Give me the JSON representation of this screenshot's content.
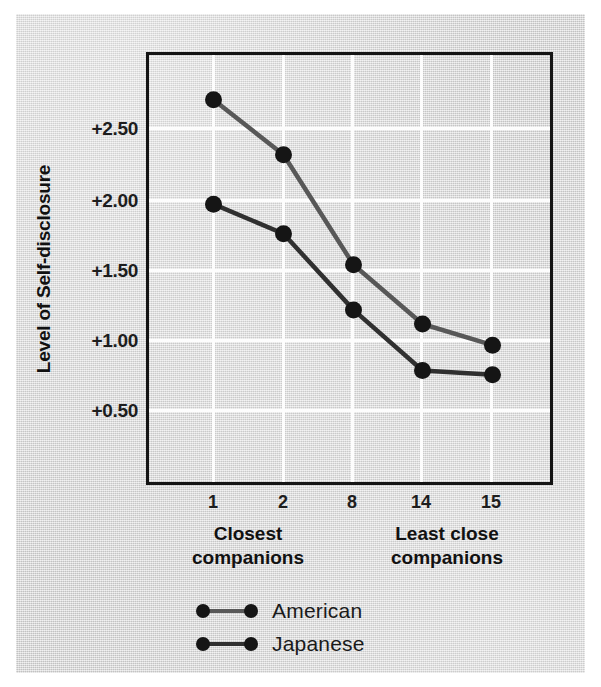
{
  "chart_data": {
    "type": "line",
    "title": "",
    "xlabel": "",
    "ylabel": "Level of Self-disclosure",
    "categories": [
      "1",
      "2",
      "8",
      "14",
      "15"
    ],
    "x_tick_labels": [
      "1",
      "2",
      "8",
      "14",
      "15"
    ],
    "y_tick_labels": [
      "+2.50",
      "+2.00",
      "+1.50",
      "+1.00",
      "+0.50"
    ],
    "y_tick_values": [
      2.5,
      2.0,
      1.5,
      1.0,
      0.5
    ],
    "ylim": [
      0.2,
      2.95
    ],
    "grid": true,
    "grid_color": "#fdfdfd",
    "legend_position": "bottom-center",
    "axis_captions": {
      "left": "Closest\ncompanions",
      "left_line1": "Closest",
      "left_line2": "companions",
      "right": "Least close\ncompanions",
      "right_line1": "Least close",
      "right_line2": "companions"
    },
    "series": [
      {
        "name": "American",
        "color": "#585858",
        "marker": "circle",
        "values": [
          2.7,
          2.31,
          1.53,
          1.11,
          0.96
        ]
      },
      {
        "name": "Japanese",
        "color": "#303030",
        "marker": "circle",
        "values": [
          1.96,
          1.75,
          1.21,
          0.78,
          0.75
        ]
      }
    ]
  },
  "legend": {
    "items": [
      {
        "label": "American",
        "color": "#585858"
      },
      {
        "label": "Japanese",
        "color": "#303030"
      }
    ]
  },
  "colors": {
    "paper": "#d7d7d7",
    "frame": "#141414",
    "grid": "#fdfdfd",
    "american": "#585858",
    "japanese": "#303030",
    "text": "#111111"
  }
}
